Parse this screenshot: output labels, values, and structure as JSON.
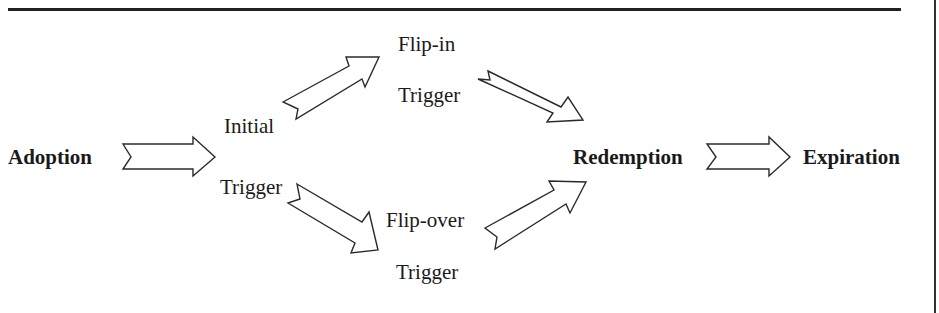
{
  "diagram": {
    "nodes": {
      "adoption": "Adoption",
      "initial": "Initial",
      "initial_trigger": "Trigger",
      "flip_in": "Flip-in",
      "flip_in_trigger": "Trigger",
      "flip_over": "Flip-over",
      "flip_over_trigger": "Trigger",
      "redemption": "Redemption",
      "expiration": "Expiration"
    },
    "edges": [
      {
        "from": "Adoption",
        "to": "Initial Trigger"
      },
      {
        "from": "Initial Trigger",
        "to": "Flip-in Trigger"
      },
      {
        "from": "Initial Trigger",
        "to": "Flip-over Trigger"
      },
      {
        "from": "Flip-in Trigger",
        "to": "Redemption"
      },
      {
        "from": "Flip-over Trigger",
        "to": "Redemption"
      },
      {
        "from": "Redemption",
        "to": "Expiration"
      }
    ],
    "colors": {
      "line": "#2a2a2a",
      "text": "#1a1a1a",
      "background": "#ffffff"
    }
  }
}
